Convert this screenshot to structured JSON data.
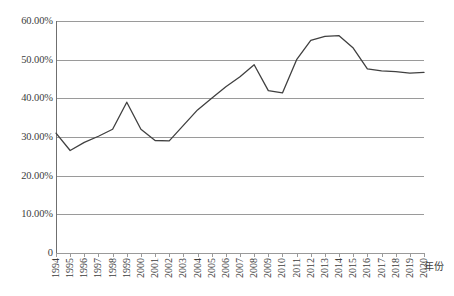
{
  "chart_data": {
    "type": "line",
    "title": "",
    "xlabel": "年份",
    "ylabel": "",
    "x": [
      1994,
      1995,
      1996,
      1997,
      1998,
      1999,
      2000,
      2001,
      2002,
      2003,
      2004,
      2005,
      2006,
      2007,
      2008,
      2009,
      2010,
      2011,
      2012,
      2013,
      2014,
      2015,
      2016,
      2017,
      2018,
      2019,
      2020
    ],
    "categories": [
      "1994",
      "1995",
      "1996",
      "1997",
      "1998",
      "1999",
      "2000",
      "2001",
      "2002",
      "2003",
      "2004",
      "2005",
      "2006",
      "2007",
      "2008",
      "2009",
      "2010",
      "2011",
      "2012",
      "2013",
      "2014",
      "2015",
      "2016",
      "2017",
      "2018",
      "2019",
      "2020"
    ],
    "values": [
      31.0,
      26.5,
      28.6,
      30.2,
      32.0,
      39.0,
      32.0,
      29.1,
      29.0,
      33.0,
      37.0,
      40.0,
      43.0,
      45.6,
      48.7,
      42.0,
      41.4,
      50.0,
      55.0,
      56.0,
      56.2,
      53.0,
      47.6,
      47.1,
      46.9,
      46.5,
      46.7
    ],
    "series": [
      {
        "name": "",
        "color": "#404040",
        "values": [
          31.0,
          26.5,
          28.6,
          30.2,
          32.0,
          39.0,
          32.0,
          29.1,
          29.0,
          33.0,
          37.0,
          40.0,
          43.0,
          45.6,
          48.7,
          42.0,
          41.4,
          50.0,
          55.0,
          56.0,
          56.2,
          53.0,
          47.6,
          47.1,
          46.9,
          46.5,
          46.7
        ]
      }
    ],
    "ylim": [
      0,
      60
    ],
    "yticks": [
      0,
      10,
      20,
      30,
      40,
      50,
      60
    ],
    "ytick_labels": [
      "0",
      "10.00%",
      "20.00%",
      "30.00%",
      "40.00%",
      "50.00%",
      "60.00%"
    ],
    "grid": true,
    "grid_axis": "y",
    "legend": false,
    "legend_position": "none",
    "units": "percent"
  },
  "axis": {
    "x_title": "年份",
    "y_tick_0": "0",
    "y_tick_10": "10.00%",
    "y_tick_20": "20.00%",
    "y_tick_30": "30.00%",
    "y_tick_40": "40.00%",
    "y_tick_50": "50.00%",
    "y_tick_60": "60.00%"
  },
  "colors": {
    "line": "#404040",
    "grid": "#9a9a9a",
    "axis": "#6f6f6f",
    "text": "#3d3d3d",
    "background": "#ffffff"
  }
}
